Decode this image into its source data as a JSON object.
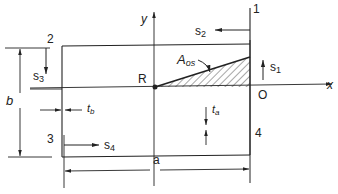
{
  "figure": {
    "type": "cross-section diagram",
    "colors": {
      "ink": "#222222",
      "background": "#ffffff"
    },
    "labels": {
      "corner_1": "1",
      "corner_2": "2",
      "corner_3": "3",
      "corner_4": "4",
      "point_R": "R",
      "origin_O": "O",
      "axis_x": "x",
      "axis_y": "y",
      "area": "A",
      "area_sub": "os",
      "s1": "s",
      "s1_sub": "1",
      "s2": "s",
      "s2_sub": "2",
      "s3": "s",
      "s3_sub": "3",
      "s4": "s",
      "s4_sub": "4",
      "width_a": "a",
      "height_b": "b",
      "thickness_b": "t",
      "thickness_b_sub": "b",
      "thickness_a": "t",
      "thickness_a_sub": "a"
    }
  }
}
